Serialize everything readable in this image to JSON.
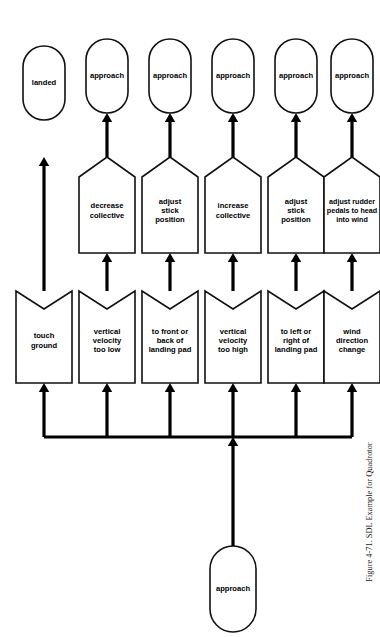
{
  "figure": {
    "caption": "Figure 4-71.   SDL Example for Quadrotor",
    "orientation": "rotated-90-ccw",
    "background_color": "#ffffff",
    "line_color": "#000000",
    "shape_fill": "#ffffff"
  },
  "start": {
    "label": "approach",
    "shape": "rounded-rectangle"
  },
  "rows": [
    {
      "trigger": {
        "label": "touch ground",
        "lines": [
          "touch",
          "ground"
        ],
        "shape": "banner-input"
      },
      "action": null,
      "result": {
        "label": "landed",
        "lines": [
          "landed"
        ],
        "shape": "rounded-rectangle"
      }
    },
    {
      "trigger": {
        "label": "vertical velocity too low",
        "lines": [
          "vertical",
          "velocity",
          "too low"
        ],
        "shape": "banner-input"
      },
      "action": {
        "label": "decrease collective",
        "lines": [
          "decrease",
          "collective"
        ],
        "shape": "pentagon-output"
      },
      "result": {
        "label": "approach",
        "lines": [
          "approach"
        ],
        "shape": "rounded-rectangle"
      }
    },
    {
      "trigger": {
        "label": "to front or back of landing pad",
        "lines": [
          "to front or",
          "back of",
          "landing pad"
        ],
        "shape": "banner-input"
      },
      "action": {
        "label": "adjust stick position",
        "lines": [
          "adjust",
          "stick",
          "position"
        ],
        "shape": "pentagon-output"
      },
      "result": {
        "label": "approach",
        "lines": [
          "approach"
        ],
        "shape": "rounded-rectangle"
      }
    },
    {
      "trigger": {
        "label": "vertical velocity too high",
        "lines": [
          "vertical",
          "velocity",
          "too high"
        ],
        "shape": "banner-input"
      },
      "action": {
        "label": "increase collective",
        "lines": [
          "increase",
          "collective"
        ],
        "shape": "pentagon-output"
      },
      "result": {
        "label": "approach",
        "lines": [
          "approach"
        ],
        "shape": "rounded-rectangle"
      }
    },
    {
      "trigger": {
        "label": "to left or right of landing pad",
        "lines": [
          "to left or",
          "right of",
          "landing pad"
        ],
        "shape": "banner-input"
      },
      "action": {
        "label": "adjust stick position",
        "lines": [
          "adjust",
          "stick",
          "position"
        ],
        "shape": "pentagon-output"
      },
      "result": {
        "label": "approach",
        "lines": [
          "approach"
        ],
        "shape": "rounded-rectangle"
      }
    },
    {
      "trigger": {
        "label": "wind direction change",
        "lines": [
          "wind",
          "direction",
          "change"
        ],
        "shape": "banner-input"
      },
      "action": {
        "label": "adjust rudder pedals to head into wind",
        "lines": [
          "adjust rudder",
          "pedals to head",
          "into wind"
        ],
        "shape": "pentagon-output"
      },
      "result": {
        "label": "approach",
        "lines": [
          "approach"
        ],
        "shape": "rounded-rectangle"
      }
    }
  ]
}
